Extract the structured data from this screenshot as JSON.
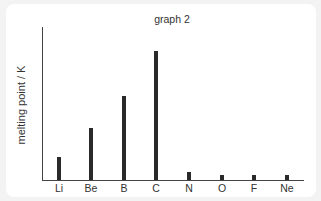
{
  "chart_data": {
    "type": "bar",
    "title": "graph 2",
    "xlabel": "",
    "ylabel": "melting point / K",
    "categories": [
      "Li",
      "Be",
      "B",
      "C",
      "N",
      "O",
      "F",
      "Ne"
    ],
    "values": [
      454,
      1560,
      2349,
      3800,
      63,
      54,
      53,
      25
    ],
    "pixel_heights": [
      23,
      52,
      84,
      129,
      8,
      5,
      5,
      5
    ],
    "x_centers": [
      59,
      91,
      124,
      156,
      189,
      222,
      254,
      287
    ],
    "grid": false,
    "y_ticks_shown": false,
    "legend": null,
    "colors": {
      "bar": "#2a2a2a",
      "axis": "#444444",
      "text": "#333333"
    }
  }
}
